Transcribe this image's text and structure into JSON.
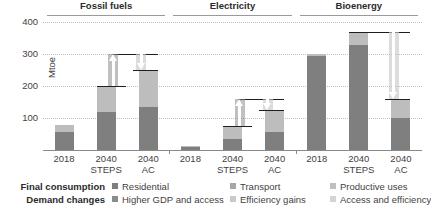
{
  "chart_data": {
    "type": "bar",
    "title": "",
    "ylabel": "Mtoe",
    "xlabel": "",
    "ylim": [
      0,
      420
    ],
    "yticks": [
      100,
      200,
      300,
      400
    ],
    "grid": true,
    "legend_position": "bottom",
    "panels": [
      {
        "title": "Fossil fuels",
        "categories": [
          "2018",
          "2040 STEPS",
          "2040 AC"
        ],
        "series": [
          {
            "name": "Residential",
            "values": [
              55,
              120,
              135
            ]
          },
          {
            "name": "Transport",
            "values": [
              22,
              80,
              115
            ]
          },
          {
            "name": "Productive uses",
            "values": [
              0,
              0,
              0
            ]
          },
          {
            "name": "Higher GDP and access",
            "values": [
              0,
              100,
              0
            ]
          },
          {
            "name": "Access and efficiency",
            "values": [
              0,
              0,
              45
            ]
          },
          {
            "name": "Efficiency gains",
            "values": [
              0,
              0,
              0
            ]
          }
        ],
        "totals": [
          77,
          200,
          250
        ],
        "waterfall": [
          {
            "from": 200,
            "to": 300,
            "direction": "up",
            "label": "Higher GDP and access"
          },
          {
            "from": 300,
            "to": 260,
            "direction": "down",
            "label": "Efficiency gains"
          }
        ]
      },
      {
        "title": "Electricity",
        "categories": [
          "2018",
          "2040 STEPS",
          "2040 AC"
        ],
        "series": [
          {
            "name": "Residential",
            "values": [
              8,
              35,
              55
            ]
          },
          {
            "name": "Transport",
            "values": [
              6,
              40,
              70
            ]
          },
          {
            "name": "Productive uses",
            "values": [
              0,
              0,
              0
            ]
          },
          {
            "name": "Higher GDP and access",
            "values": [
              0,
              80,
              0
            ]
          },
          {
            "name": "Access and efficiency",
            "values": [
              0,
              0,
              0
            ]
          },
          {
            "name": "Efficiency gains",
            "values": [
              0,
              0,
              40
            ]
          }
        ],
        "totals": [
          14,
          75,
          125
        ],
        "waterfall": [
          {
            "from": 75,
            "to": 160,
            "direction": "up",
            "label": "Higher GDP and access"
          },
          {
            "from": 160,
            "to": 125,
            "direction": "down",
            "label": "Efficiency gains"
          }
        ]
      },
      {
        "title": "Bioenergy",
        "categories": [
          "2018",
          "2040 STEPS",
          "2040 AC"
        ],
        "series": [
          {
            "name": "Residential",
            "values": [
              295,
              330,
              100
            ]
          },
          {
            "name": "Transport",
            "values": [
              5,
              40,
              60
            ]
          },
          {
            "name": "Productive uses",
            "values": [
              0,
              0,
              0
            ]
          },
          {
            "name": "Higher GDP and access",
            "values": [
              0,
              0,
              0
            ]
          },
          {
            "name": "Access and efficiency",
            "values": [
              0,
              0,
              0
            ]
          },
          {
            "name": "Efficiency gains",
            "values": [
              0,
              0,
              0
            ]
          }
        ],
        "totals": [
          300,
          370,
          160
        ],
        "waterfall": [
          {
            "from": 370,
            "to": 370,
            "direction": "flat",
            "label": ""
          },
          {
            "from": 370,
            "to": 165,
            "direction": "down",
            "label": "Access and efficiency"
          }
        ]
      }
    ]
  },
  "axis": {
    "ylabel": "Mtoe",
    "yticks": [
      "400",
      "300",
      "200",
      "100"
    ],
    "xlabels": [
      {
        "line1": "2018",
        "line2": ""
      },
      {
        "line1": "2040",
        "line2": "STEPS"
      },
      {
        "line1": "2040",
        "line2": "AC"
      },
      {
        "line1": "2018",
        "line2": ""
      },
      {
        "line1": "2040",
        "line2": "STEPS"
      },
      {
        "line1": "2040",
        "line2": "AC"
      },
      {
        "line1": "2018",
        "line2": ""
      },
      {
        "line1": "2040",
        "line2": "STEPS"
      },
      {
        "line1": "2040",
        "line2": "AC"
      }
    ]
  },
  "panel_titles": [
    "Fossil fuels",
    "Electricity",
    "Bioenergy"
  ],
  "legend": {
    "row_labels": [
      "Final consumption",
      "Demand changes"
    ],
    "row1": [
      {
        "label": "Residential",
        "color": "#7f7f7f"
      },
      {
        "label": "Transport",
        "color": "#a6a6a6"
      },
      {
        "label": "Productive uses",
        "color": "#bfbfbf"
      }
    ],
    "row2": [
      {
        "label": "Higher GDP and access",
        "color": "#8c8c8c"
      },
      {
        "label": "Efficiency gains",
        "color": "#c9c9c9"
      },
      {
        "label": "Access and efficiency",
        "color": "#d4d4d4"
      }
    ]
  },
  "colors": {
    "residential": "#7f7f7f",
    "transport": "#bdbdbd",
    "productive_uses": "#c4c4c4",
    "higher_gdp": "#8c8c8c",
    "efficiency_gains": "#c9c9c9",
    "access_efficiency": "#d4d4d4",
    "connector": "#1f1f1f",
    "gridline": "#bfbfbf",
    "axis": "#8a8a8a",
    "text": "#3f3f3f"
  }
}
